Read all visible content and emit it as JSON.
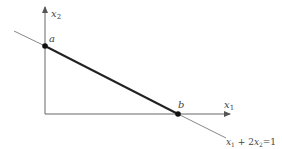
{
  "diagram": {
    "axes": {
      "x_label": "x",
      "x_sub": "1",
      "y_label": "x",
      "y_sub": "2"
    },
    "points": [
      {
        "name": "a",
        "label": "a"
      },
      {
        "name": "b",
        "label": "b"
      }
    ],
    "line_equation": {
      "t1": "x",
      "s1": "1",
      "plus": " + 2",
      "t2": "x",
      "s2": "2",
      "rhs": "=1"
    },
    "colors": {
      "axis": "#555555",
      "line": "#222222",
      "extension": "#777777",
      "point": "#111111"
    }
  }
}
